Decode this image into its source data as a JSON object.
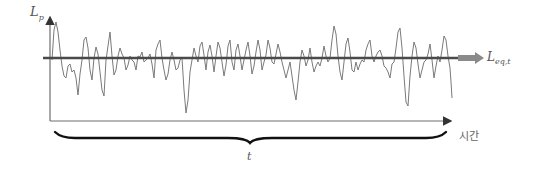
{
  "diagram": {
    "labels": {
      "y_axis_main": "L",
      "y_axis_sub": "p",
      "leq_main": "L",
      "leq_sub": "eq,t",
      "x_axis": "시간",
      "brace": "t"
    },
    "colors": {
      "axis": "#6e6e6e",
      "waveform": "#7a7a7a",
      "leq_line": "#4a4a4a",
      "leq_arrow": "#8a8a8a",
      "brace": "#111111",
      "text": "#555555"
    },
    "geometry": {
      "y_axis": {
        "x": 50,
        "top": 12,
        "bottom": 121
      },
      "x_axis": {
        "y": 121,
        "left": 50,
        "right": 456
      },
      "leq_line": {
        "y": 58,
        "left": 43,
        "right": 458
      },
      "leq_arrow": {
        "x1": 458,
        "x2": 484,
        "y": 58
      },
      "brace": {
        "left": 55,
        "right": 446,
        "mid": 250,
        "top": 132,
        "tip": 143
      }
    },
    "waveform_points": [
      [
        52,
        60
      ],
      [
        54,
        30
      ],
      [
        56,
        22
      ],
      [
        58,
        32
      ],
      [
        60,
        50
      ],
      [
        62,
        66
      ],
      [
        64,
        76
      ],
      [
        66,
        78
      ],
      [
        68,
        66
      ],
      [
        70,
        64
      ],
      [
        72,
        72
      ],
      [
        74,
        70
      ],
      [
        76,
        78
      ],
      [
        78,
        95
      ],
      [
        80,
        74
      ],
      [
        82,
        60
      ],
      [
        84,
        40
      ],
      [
        86,
        37
      ],
      [
        88,
        48
      ],
      [
        90,
        70
      ],
      [
        92,
        80
      ],
      [
        94,
        58
      ],
      [
        96,
        47
      ],
      [
        98,
        54
      ],
      [
        100,
        72
      ],
      [
        102,
        90
      ],
      [
        104,
        96
      ],
      [
        106,
        60
      ],
      [
        108,
        46
      ],
      [
        110,
        32
      ],
      [
        112,
        56
      ],
      [
        114,
        75
      ],
      [
        116,
        70
      ],
      [
        118,
        56
      ],
      [
        120,
        48
      ],
      [
        122,
        54
      ],
      [
        124,
        58
      ],
      [
        126,
        70
      ],
      [
        128,
        65
      ],
      [
        130,
        56
      ],
      [
        132,
        60
      ],
      [
        134,
        62
      ],
      [
        136,
        70
      ],
      [
        138,
        56
      ],
      [
        140,
        57
      ],
      [
        142,
        52
      ],
      [
        144,
        62
      ],
      [
        146,
        60
      ],
      [
        148,
        58
      ],
      [
        150,
        54
      ],
      [
        152,
        64
      ],
      [
        154,
        78
      ],
      [
        156,
        50
      ],
      [
        158,
        44
      ],
      [
        160,
        40
      ],
      [
        162,
        58
      ],
      [
        164,
        70
      ],
      [
        166,
        80
      ],
      [
        168,
        74
      ],
      [
        170,
        60
      ],
      [
        172,
        52
      ],
      [
        174,
        60
      ],
      [
        176,
        70
      ],
      [
        178,
        68
      ],
      [
        180,
        60
      ],
      [
        182,
        58
      ],
      [
        184,
        90
      ],
      [
        186,
        113
      ],
      [
        188,
        100
      ],
      [
        190,
        72
      ],
      [
        192,
        60
      ],
      [
        194,
        48
      ],
      [
        196,
        56
      ],
      [
        198,
        62
      ],
      [
        200,
        46
      ],
      [
        202,
        42
      ],
      [
        204,
        55
      ],
      [
        206,
        70
      ],
      [
        208,
        52
      ],
      [
        210,
        45
      ],
      [
        212,
        56
      ],
      [
        214,
        72
      ],
      [
        216,
        56
      ],
      [
        218,
        42
      ],
      [
        220,
        48
      ],
      [
        222,
        62
      ],
      [
        224,
        76
      ],
      [
        226,
        65
      ],
      [
        228,
        46
      ],
      [
        230,
        40
      ],
      [
        232,
        62
      ],
      [
        234,
        70
      ],
      [
        236,
        50
      ],
      [
        238,
        44
      ],
      [
        240,
        56
      ],
      [
        242,
        70
      ],
      [
        244,
        60
      ],
      [
        246,
        50
      ],
      [
        248,
        42
      ],
      [
        250,
        56
      ],
      [
        252,
        74
      ],
      [
        254,
        66
      ],
      [
        256,
        52
      ],
      [
        258,
        40
      ],
      [
        260,
        50
      ],
      [
        262,
        70
      ],
      [
        264,
        62
      ],
      [
        266,
        55
      ],
      [
        268,
        40
      ],
      [
        270,
        48
      ],
      [
        272,
        62
      ],
      [
        274,
        64
      ],
      [
        276,
        54
      ],
      [
        278,
        44
      ],
      [
        280,
        52
      ],
      [
        282,
        62
      ],
      [
        284,
        70
      ],
      [
        286,
        78
      ],
      [
        288,
        70
      ],
      [
        290,
        62
      ],
      [
        292,
        76
      ],
      [
        294,
        90
      ],
      [
        296,
        100
      ],
      [
        298,
        82
      ],
      [
        300,
        62
      ],
      [
        302,
        50
      ],
      [
        304,
        56
      ],
      [
        306,
        66
      ],
      [
        308,
        60
      ],
      [
        310,
        48
      ],
      [
        312,
        62
      ],
      [
        314,
        72
      ],
      [
        316,
        66
      ],
      [
        318,
        62
      ],
      [
        320,
        66
      ],
      [
        322,
        58
      ],
      [
        324,
        46
      ],
      [
        326,
        56
      ],
      [
        328,
        62
      ],
      [
        330,
        58
      ],
      [
        332,
        40
      ],
      [
        334,
        26
      ],
      [
        336,
        34
      ],
      [
        338,
        56
      ],
      [
        340,
        72
      ],
      [
        342,
        80
      ],
      [
        344,
        62
      ],
      [
        346,
        44
      ],
      [
        348,
        38
      ],
      [
        350,
        52
      ],
      [
        352,
        70
      ],
      [
        354,
        72
      ],
      [
        356,
        62
      ],
      [
        358,
        70
      ],
      [
        360,
        64
      ],
      [
        362,
        60
      ],
      [
        364,
        62
      ],
      [
        366,
        50
      ],
      [
        368,
        44
      ],
      [
        370,
        40
      ],
      [
        372,
        56
      ],
      [
        374,
        62
      ],
      [
        376,
        56
      ],
      [
        378,
        52
      ],
      [
        380,
        50
      ],
      [
        382,
        56
      ],
      [
        384,
        66
      ],
      [
        386,
        68
      ],
      [
        388,
        72
      ],
      [
        390,
        78
      ],
      [
        392,
        64
      ],
      [
        394,
        62
      ],
      [
        396,
        48
      ],
      [
        398,
        32
      ],
      [
        400,
        28
      ],
      [
        402,
        48
      ],
      [
        404,
        76
      ],
      [
        406,
        102
      ],
      [
        408,
        106
      ],
      [
        410,
        76
      ],
      [
        412,
        56
      ],
      [
        414,
        42
      ],
      [
        416,
        48
      ],
      [
        418,
        64
      ],
      [
        420,
        78
      ],
      [
        422,
        70
      ],
      [
        424,
        62
      ],
      [
        426,
        60
      ],
      [
        428,
        54
      ],
      [
        430,
        44
      ],
      [
        432,
        60
      ],
      [
        434,
        78
      ],
      [
        436,
        66
      ],
      [
        438,
        56
      ],
      [
        440,
        62
      ],
      [
        442,
        50
      ],
      [
        444,
        36
      ],
      [
        446,
        40
      ],
      [
        448,
        56
      ],
      [
        450,
        68
      ],
      [
        451,
        82
      ],
      [
        452,
        98
      ]
    ]
  }
}
